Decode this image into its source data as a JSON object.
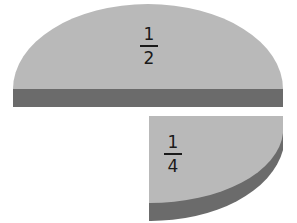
{
  "diagram": {
    "colors": {
      "face": "#b9b9b9",
      "side": "#6b6b6b",
      "background": "#ffffff",
      "text": "#1a1a1a"
    },
    "pieces": [
      {
        "label": "half-piece",
        "numerator": "1",
        "denominator": "2"
      },
      {
        "label": "quarter-piece",
        "numerator": "1",
        "denominator": "4"
      }
    ]
  }
}
